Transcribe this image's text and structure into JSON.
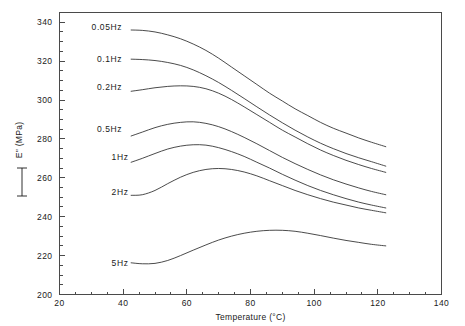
{
  "chart_data": {
    "type": "line",
    "title": "",
    "xlabel": "Temperature (°C)",
    "ylabel": "E\" (MPa)",
    "xlim": [
      20,
      140
    ],
    "ylim": [
      200,
      345
    ],
    "xticks": [
      20,
      40,
      60,
      80,
      100,
      120,
      140
    ],
    "xticklabels": [
      "20",
      "40",
      "60",
      "80",
      "100",
      "120",
      "140"
    ],
    "yticks": [
      200,
      220,
      240,
      260,
      280,
      300,
      320,
      340
    ],
    "yticklabels": [
      "200",
      "220",
      "240",
      "260",
      "280",
      "300",
      "320",
      "340"
    ],
    "xminor_step": 5,
    "yminor_step": 5,
    "grid": false,
    "legend_position": "inline-left-of-curves",
    "series": [
      {
        "name": "0.05Hz",
        "label": "0.05Hz",
        "label_x": 42.5,
        "label_y": 337.5,
        "x": [
          42.5,
          46,
          50,
          54,
          58,
          62,
          66,
          70,
          74,
          78,
          82,
          86,
          90,
          94,
          98,
          102,
          106,
          110,
          114,
          118,
          122.5
        ],
        "y": [
          336.0,
          335.8,
          335.0,
          333.5,
          331.5,
          328.8,
          325.5,
          321.5,
          317.0,
          312.5,
          308.0,
          303.5,
          299.5,
          295.5,
          292.0,
          288.5,
          285.5,
          283.0,
          280.5,
          278.3,
          276.0
        ]
      },
      {
        "name": "0.1Hz",
        "label": "0.1Hz",
        "label_x": 42.5,
        "label_y": 321.0,
        "x": [
          42.5,
          46,
          50,
          54,
          58,
          62,
          66,
          70,
          74,
          78,
          82,
          86,
          90,
          94,
          98,
          102,
          106,
          110,
          114,
          118,
          122.5
        ],
        "y": [
          321.0,
          320.8,
          320.3,
          319.3,
          317.8,
          315.5,
          312.5,
          309.0,
          305.0,
          300.8,
          296.5,
          292.3,
          288.3,
          284.5,
          281.0,
          277.8,
          275.0,
          272.5,
          270.3,
          268.3,
          266.0
        ]
      },
      {
        "name": "0.2Hz",
        "label": "0.2Hz",
        "label_x": 42.5,
        "label_y": 306.5,
        "x": [
          42.5,
          46,
          50,
          54,
          58,
          62,
          66,
          70,
          74,
          78,
          82,
          86,
          90,
          94,
          98,
          102,
          106,
          110,
          114,
          118,
          122.5
        ],
        "y": [
          304.5,
          305.3,
          306.3,
          307.0,
          307.3,
          307.0,
          305.8,
          303.5,
          300.3,
          296.5,
          292.5,
          288.5,
          284.5,
          281.0,
          277.5,
          274.3,
          271.5,
          269.0,
          266.8,
          264.8,
          262.8
        ]
      },
      {
        "name": "0.5Hz",
        "label": "0.5Hz",
        "label_x": 42.5,
        "label_y": 285.0,
        "x": [
          42.5,
          46,
          50,
          54,
          58,
          62,
          66,
          70,
          74,
          78,
          82,
          86,
          90,
          94,
          98,
          102,
          106,
          110,
          114,
          118,
          122.5
        ],
        "y": [
          281.5,
          283.5,
          285.8,
          287.5,
          288.5,
          288.8,
          288.0,
          286.3,
          283.8,
          280.8,
          277.5,
          274.0,
          270.5,
          267.3,
          264.3,
          261.5,
          259.0,
          256.8,
          254.8,
          253.0,
          251.3
        ]
      },
      {
        "name": "1Hz",
        "label": "1Hz",
        "label_x": 44.5,
        "label_y": 271.0,
        "x": [
          42.5,
          46,
          50,
          54,
          58,
          62,
          66,
          70,
          74,
          78,
          82,
          86,
          90,
          94,
          98,
          102,
          106,
          110,
          114,
          118,
          122.5
        ],
        "y": [
          268.0,
          270.0,
          272.5,
          274.8,
          276.3,
          277.0,
          276.8,
          275.5,
          273.5,
          271.0,
          268.0,
          265.0,
          261.8,
          258.8,
          256.0,
          253.5,
          251.3,
          249.3,
          247.5,
          246.0,
          244.5
        ]
      },
      {
        "name": "2Hz",
        "label": "2Hz",
        "label_x": 44.5,
        "label_y": 252.5,
        "x": [
          42.5,
          46,
          50,
          54,
          58,
          62,
          66,
          70,
          74,
          78,
          82,
          86,
          90,
          94,
          98,
          102,
          106,
          110,
          114,
          118,
          122.5
        ],
        "y": [
          251.0,
          251.3,
          253.5,
          257.0,
          260.3,
          262.8,
          264.3,
          264.8,
          264.3,
          263.0,
          261.0,
          258.5,
          256.0,
          253.5,
          251.3,
          249.3,
          247.5,
          246.0,
          244.5,
          243.3,
          242.0
        ]
      },
      {
        "name": "5Hz",
        "label": "5Hz",
        "label_x": 44.5,
        "label_y": 216.0,
        "x": [
          42.5,
          46,
          50,
          54,
          58,
          62,
          66,
          70,
          74,
          78,
          82,
          86,
          90,
          94,
          98,
          102,
          106,
          110,
          114,
          118,
          122.5
        ],
        "y": [
          216.3,
          215.8,
          216.0,
          217.5,
          220.0,
          222.8,
          225.5,
          228.0,
          230.0,
          231.5,
          232.5,
          233.0,
          233.0,
          232.5,
          231.5,
          230.3,
          229.0,
          227.8,
          226.8,
          225.8,
          225.0
        ]
      }
    ]
  }
}
